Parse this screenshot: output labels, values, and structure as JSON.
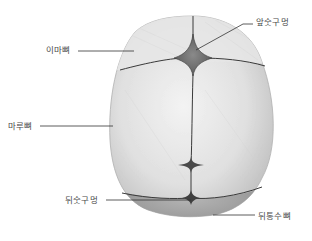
{
  "diagram": {
    "labels": {
      "anterior_fontanelle": "앞숫구멍",
      "frontal_bone": "이마뼈",
      "parietal_bone": "마루뼈",
      "posterior_fontanelle": "뒤숫구멍",
      "occipital_bone": "뒤통수뼈"
    },
    "colors": {
      "bone": "#d9d9d9",
      "bone_highlight": "#f2f2f2",
      "suture": "#3a3a3a",
      "fontanelle": "#6e6e6e",
      "leader_line": "#333333",
      "label_text": "#4a4a4a"
    }
  }
}
